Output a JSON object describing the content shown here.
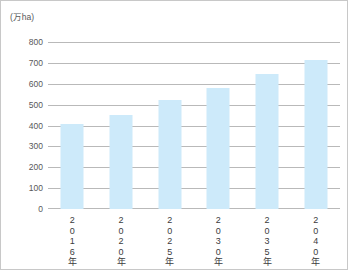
{
  "chart_data": {
    "type": "bar",
    "title": "",
    "subtitle": "",
    "unit_label": "(万ha)",
    "xlabel": "",
    "ylabel": "万ha",
    "categories": [
      "2016年",
      "2020年",
      "2025年",
      "2030年",
      "2035年",
      "2040年"
    ],
    "values": [
      405,
      450,
      520,
      580,
      645,
      715
    ],
    "series": [
      {
        "name": "面積",
        "values": [
          405,
          450,
          520,
          580,
          645,
          715
        ]
      }
    ],
    "ylim": [
      0,
      800
    ],
    "ytick_values": [
      800,
      700,
      600,
      500,
      400,
      300,
      200,
      100,
      0
    ],
    "ytick_labels": [
      "800",
      "700",
      "600",
      "500",
      "400",
      "300",
      "200",
      "100",
      "0"
    ],
    "grid": true,
    "grid_axis": "y",
    "legend": false,
    "legend_position": "none",
    "bar_color": "#cdeafa",
    "grid_color": "#b9b9b9",
    "axis_text_color": "#58585a",
    "category_text_color": "#3b3b3d",
    "border_color": "#c8c8c8",
    "background_color": "#ffffff"
  },
  "figure": {
    "unit": "(万ha)",
    "categories_vertical_chars": [
      [
        "2",
        "0",
        "1",
        "6",
        "年"
      ],
      [
        "2",
        "0",
        "2",
        "0",
        "年"
      ],
      [
        "2",
        "0",
        "2",
        "5",
        "年"
      ],
      [
        "2",
        "0",
        "3",
        "0",
        "年"
      ],
      [
        "2",
        "0",
        "3",
        "5",
        "年"
      ],
      [
        "2",
        "0",
        "4",
        "0",
        "年"
      ]
    ]
  }
}
